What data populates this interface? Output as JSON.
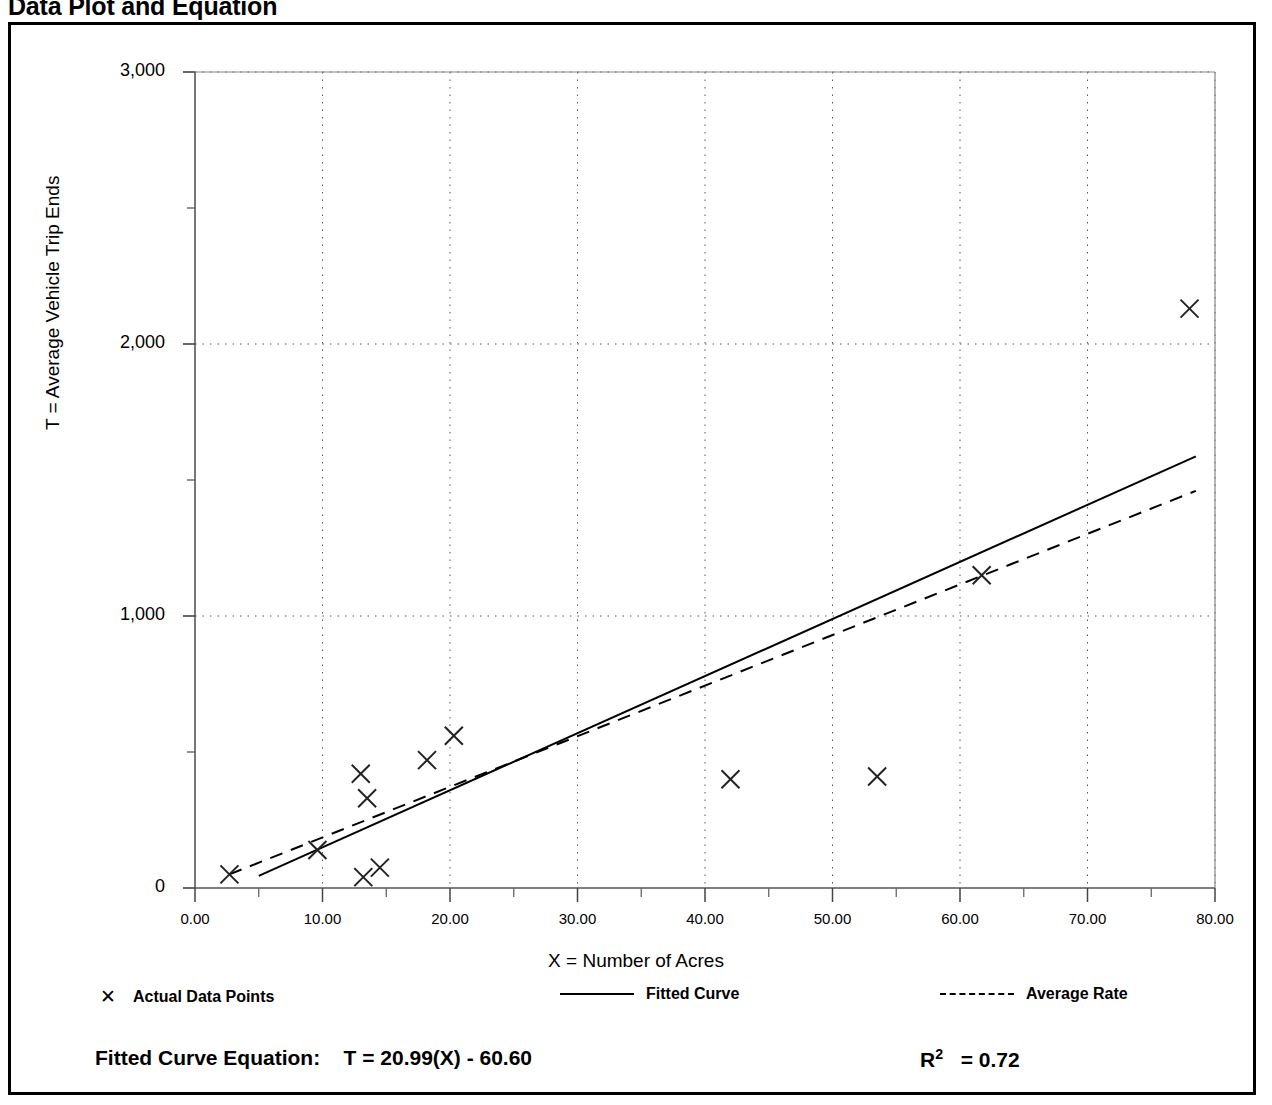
{
  "page": {
    "title": "Data Plot and Equation"
  },
  "chart_data": {
    "type": "scatter",
    "title": "Data Plot and Equation",
    "xlabel": "X = Number of Acres",
    "ylabel": "T = Average Vehicle Trip Ends",
    "xlim": [
      0,
      80
    ],
    "ylim": [
      0,
      3000
    ],
    "grid": true,
    "x_ticks": [
      "0.00",
      "10.00",
      "20.00",
      "30.00",
      "40.00",
      "50.00",
      "60.00",
      "70.00",
      "80.00"
    ],
    "x_tick_values": [
      0,
      10,
      20,
      30,
      40,
      50,
      60,
      70,
      80
    ],
    "y_ticks": [
      "0",
      "1,000",
      "2,000",
      "3,000"
    ],
    "y_tick_values": [
      0,
      1000,
      2000,
      3000
    ],
    "y_minor_tick_values": [
      500,
      1500,
      2500
    ],
    "series": [
      {
        "name": "Actual Data Points",
        "type": "scatter",
        "marker": "x",
        "points": [
          {
            "x": 2.7,
            "y": 50
          },
          {
            "x": 9.6,
            "y": 140
          },
          {
            "x": 13.0,
            "y": 420
          },
          {
            "x": 13.2,
            "y": 40
          },
          {
            "x": 13.5,
            "y": 330
          },
          {
            "x": 14.5,
            "y": 75
          },
          {
            "x": 18.2,
            "y": 470
          },
          {
            "x": 20.3,
            "y": 560
          },
          {
            "x": 42.0,
            "y": 400
          },
          {
            "x": 53.5,
            "y": 410
          },
          {
            "x": 61.7,
            "y": 1150
          },
          {
            "x": 78.0,
            "y": 2130
          }
        ]
      },
      {
        "name": "Fitted Curve",
        "type": "line",
        "style": "solid",
        "equation": "T = 20.99(X) - 60.60",
        "slope": 20.99,
        "intercept": -60.6,
        "x_start": 5.0,
        "x_end": 78.5
      },
      {
        "name": "Average Rate",
        "type": "line",
        "style": "dashed",
        "slope": 18.6,
        "intercept": 0,
        "x_start": 2.7,
        "x_end": 78.5
      }
    ],
    "legend": {
      "position": "below-axis",
      "entries": [
        {
          "label": "Actual Data Points",
          "marker": "x"
        },
        {
          "label": "Fitted Curve",
          "marker": "solid-line"
        },
        {
          "label": "Average Rate",
          "marker": "dashed-line"
        }
      ]
    },
    "annotations": {
      "equation_label": "Fitted Curve Equation:",
      "equation_value": "T = 20.99(X) - 60.60",
      "r_squared_label": "R",
      "r_squared_exponent": "2",
      "r_squared_value": "= 0.72"
    }
  }
}
